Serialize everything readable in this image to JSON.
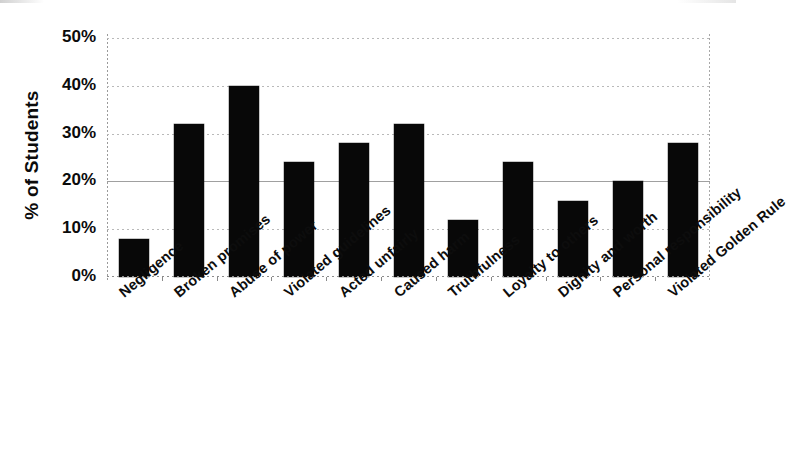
{
  "chart_data": {
    "type": "bar",
    "title": "",
    "subtitle": "",
    "xlabel": "",
    "ylabel": "% of Students",
    "ylim": [
      0,
      50
    ],
    "ytick_labels": [
      "0%",
      "10%",
      "20%",
      "30%",
      "40%",
      "50%"
    ],
    "ytick_values": [
      0,
      10,
      20,
      30,
      40,
      50
    ],
    "grid": true,
    "legend": null,
    "bar_color": "#080808",
    "categories": [
      "Negligence",
      "Broken promises",
      "Abuse of power",
      "Violated guidelines",
      "Acted unfairly",
      "Caused harm",
      "Truthfulness",
      "Loyalty to others",
      "Dignity and worth",
      "Personal responsibility",
      "Violated Golden Rule"
    ],
    "values": [
      8,
      32,
      40,
      24,
      28,
      32,
      12,
      24,
      16,
      20,
      28
    ],
    "value_labels": [
      "8%",
      "32%",
      "40%",
      "24%",
      "28%",
      "32%",
      "12%",
      "24%",
      "16%",
      "20%",
      "28%"
    ]
  }
}
